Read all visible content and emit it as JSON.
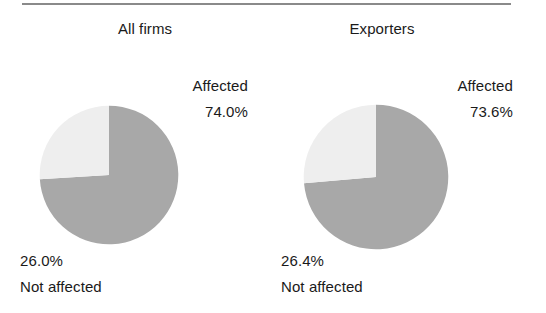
{
  "figure": {
    "divider": "horizontal-rule",
    "background_color": "#ffffff",
    "text_color": "#1a1a1a"
  },
  "colors": {
    "affected_slice": "#a8a8a8",
    "not_affected_slice": "#eeeeee",
    "rule": "#8a8a8a"
  },
  "panels": [
    {
      "title": "All firms",
      "affected_label": "Affected",
      "affected_value": "74.0%",
      "not_affected_value": "26.0%",
      "not_affected_label": "Not affected"
    },
    {
      "title": "Exporters",
      "affected_label": "Affected",
      "affected_value": "73.6%",
      "not_affected_value": "26.4%",
      "not_affected_label": "Not affected"
    }
  ],
  "chart_data": [
    {
      "type": "pie",
      "title": "All firms",
      "categories": [
        "Affected",
        "Not affected"
      ],
      "values": [
        74.0,
        26.0
      ],
      "units": "percent",
      "labels": [
        "74.0%",
        "26.0%"
      ],
      "colors": [
        "#a8a8a8",
        "#eeeeee"
      ],
      "start_angle_deg": 0,
      "direction": "clockwise",
      "legend": "none",
      "grid": false
    },
    {
      "type": "pie",
      "title": "Exporters",
      "categories": [
        "Affected",
        "Not affected"
      ],
      "values": [
        73.6,
        26.4
      ],
      "units": "percent",
      "labels": [
        "73.6%",
        "26.4%"
      ],
      "colors": [
        "#a8a8a8",
        "#eeeeee"
      ],
      "start_angle_deg": 0,
      "direction": "clockwise",
      "legend": "none",
      "grid": false
    }
  ]
}
